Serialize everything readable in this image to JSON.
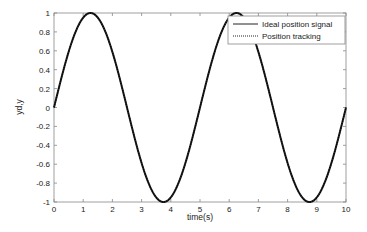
{
  "chart_data": {
    "type": "line",
    "title": "",
    "xlabel": "time(s)",
    "ylabel": "yd,y",
    "xlim": [
      0,
      10
    ],
    "ylim": [
      -1,
      1
    ],
    "xticks": [
      "0",
      "1",
      "2",
      "3",
      "4",
      "5",
      "6",
      "7",
      "8",
      "9",
      "10"
    ],
    "yticks": [
      "1",
      "0.8",
      "0.6",
      "0.4",
      "0.2",
      "0",
      "-0.2",
      "-0.4",
      "-0.6",
      "-0.8",
      "-1"
    ],
    "grid": false,
    "legend_position": "upper right",
    "series": [
      {
        "name": "Ideal position signal",
        "style": "solid",
        "color": "#000000",
        "formula": "sin(0.4*pi*t)",
        "x": [
          0,
          0.625,
          1.25,
          1.875,
          2.5,
          3.125,
          3.75,
          4.375,
          5,
          5.625,
          6.25,
          6.875,
          7.5,
          8.125,
          8.75,
          9.375,
          10
        ],
        "values": [
          0,
          0.71,
          1,
          0.71,
          0,
          -0.71,
          -1,
          -0.71,
          0,
          0.71,
          1,
          0.71,
          0,
          -0.71,
          -1,
          -0.71,
          0
        ]
      },
      {
        "name": "Position tracking",
        "style": "dotted",
        "color": "#000000",
        "formula": "sin(0.4*pi*t)",
        "x": [
          0,
          0.625,
          1.25,
          1.875,
          2.5,
          3.125,
          3.75,
          4.375,
          5,
          5.625,
          6.25,
          6.875,
          7.5,
          8.125,
          8.75,
          9.375,
          10
        ],
        "values": [
          0,
          0.71,
          1,
          0.71,
          0,
          -0.71,
          -1,
          -0.71,
          0,
          0.71,
          1,
          0.71,
          0,
          -0.71,
          -1,
          -0.71,
          0
        ]
      }
    ]
  },
  "legend": {
    "items": [
      {
        "label": "Ideal position signal",
        "style": "solid"
      },
      {
        "label": "Position tracking",
        "style": "dotted"
      }
    ]
  },
  "axes": {
    "xlabel": "time(s)",
    "ylabel": "yd,y"
  }
}
